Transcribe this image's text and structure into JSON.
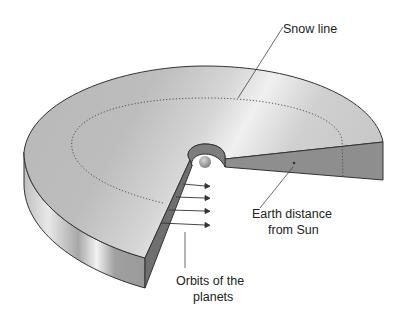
{
  "diagram": {
    "labels": {
      "snow_line": "Snow line",
      "earth_distance_line1": "Earth distance",
      "earth_distance_line2": "from Sun",
      "orbits_line1": "Orbits of the",
      "orbits_line2": "planets"
    },
    "colors": {
      "disk_top": "#c4c4c4",
      "disk_side": "#b0b0b0",
      "cut_face": "#8a8a8a",
      "sun": "#9c9c9c",
      "outline": "#333333",
      "text": "#222222"
    }
  }
}
